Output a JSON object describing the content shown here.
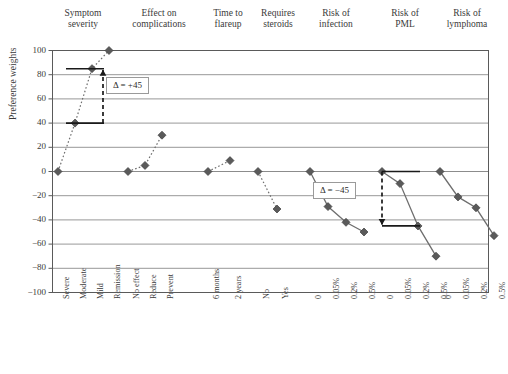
{
  "chart_data": {
    "type": "line",
    "title": "",
    "xlabel": "",
    "ylabel": "Preference weights",
    "ylim": [
      -100,
      100
    ],
    "yticks": [
      100,
      80,
      60,
      40,
      20,
      0,
      -20,
      -40,
      -60,
      -80,
      -100
    ],
    "ytick_labels": [
      "100",
      "80",
      "60",
      "40",
      "20",
      "0",
      "−20",
      "−40",
      "−60",
      "−80",
      "−100"
    ],
    "grid": true,
    "legend": "none",
    "attributes": [
      {
        "title": "Symptom\nseverity",
        "levels": [
          "Severe",
          "Moderate",
          "Mild",
          "Remission"
        ],
        "values": [
          0,
          40,
          85,
          100
        ]
      },
      {
        "title": "Effect on\ncomplications",
        "levels": [
          "No effect",
          "Reduce",
          "Prevent"
        ],
        "values": [
          0,
          5,
          30
        ]
      },
      {
        "title": "Time to\nflareup",
        "levels": [
          "6 months",
          "2 years"
        ],
        "values": [
          0,
          9
        ]
      },
      {
        "title": "Requires\nsteroids",
        "levels": [
          "No",
          "Yes"
        ],
        "values": [
          0,
          -31
        ]
      },
      {
        "title": "Risk of\ninfection",
        "levels": [
          "0",
          "0.05%",
          "0.2%",
          "0.5%"
        ],
        "values": [
          0,
          -29,
          -42,
          -50
        ]
      },
      {
        "title": "Risk of\nPML",
        "levels": [
          "0",
          "0.05%",
          "0.2%",
          "0.5%"
        ],
        "values": [
          0,
          -10,
          -45,
          -70
        ]
      },
      {
        "title": "Risk of\nlymphoma",
        "levels": [
          "0",
          "0.05%",
          "0.2%",
          "0.5%"
        ],
        "values": [
          0,
          -21,
          -30,
          -53
        ]
      }
    ],
    "annotations": [
      {
        "label": "Δ = +45",
        "attribute": "Symptom severity",
        "from_value": 40,
        "to_value": 85,
        "direction": "up"
      },
      {
        "label": "Δ = −45",
        "attribute": "Risk of PML",
        "from_value": 0,
        "to_value": -45,
        "direction": "down"
      }
    ],
    "colors": {
      "marker": "#5a5a5a",
      "line": "#6e6e6e",
      "grid": "#8c8c8c",
      "frame": "#5a5a5a",
      "annotation": "#1a1a1a"
    }
  }
}
